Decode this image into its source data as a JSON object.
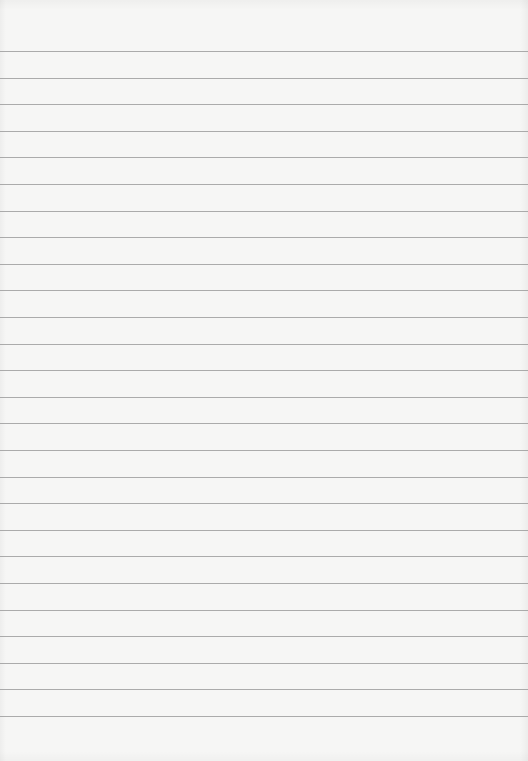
{
  "page": {
    "type": "blank-lined-paper",
    "background_color": "#f6f6f5",
    "line_color": "#9e9e9e",
    "line_count": 26,
    "first_line_y": 51,
    "line_spacing": 26.6,
    "text_content": []
  }
}
